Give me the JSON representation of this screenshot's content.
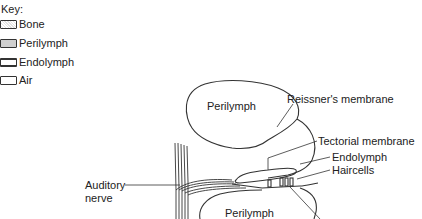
{
  "key": {
    "title": "Key:",
    "items": [
      {
        "label": "Bone",
        "swatch": "bone"
      },
      {
        "label": "Perilymph",
        "swatch": "perilymph"
      },
      {
        "label": "Endolymph",
        "swatch": "endolymph"
      },
      {
        "label": "Air",
        "swatch": "air"
      }
    ]
  },
  "diagram": {
    "regions": {
      "upper": "Perilymph",
      "lower": "Perilymph"
    },
    "labels": {
      "reissners": "Reissner's membrane",
      "tectorial": "Tectorial membrane",
      "endolymph": "Endolymph",
      "haircells": "Haircells",
      "auditory_line1": "Auditory",
      "auditory_line2": "nerve"
    },
    "colors": {
      "line": "#333333",
      "text": "#222222"
    }
  }
}
